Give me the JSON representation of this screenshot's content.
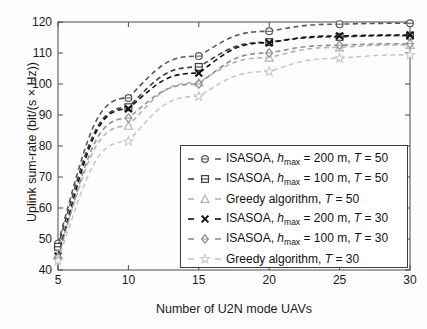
{
  "chart_data": {
    "type": "line",
    "title": "",
    "xlabel": "Number of U2N mode UAVs",
    "ylabel": "Uplink sum-rate (bit/(s × Hz))",
    "x": [
      5,
      10,
      15,
      20,
      25,
      30
    ],
    "xlim": [
      5,
      30
    ],
    "ylim": [
      40,
      120
    ],
    "xticks": [
      "5",
      "10",
      "15",
      "20",
      "25",
      "30"
    ],
    "yticks": [
      "40",
      "50",
      "60",
      "70",
      "80",
      "90",
      "100",
      "110",
      "120"
    ],
    "grid": false,
    "legend_position": "lower-right-inside",
    "series": [
      {
        "name": "ISASOA, h_max = 200 m, T = 50",
        "marker": "circle",
        "color": "#585858",
        "linestyle": "dashed",
        "values": [
          48.5,
          95.5,
          109.0,
          117.0,
          119.3,
          119.6
        ]
      },
      {
        "name": "ISASOA, h_max = 100 m, T = 50",
        "marker": "square",
        "color": "#404040",
        "linestyle": "dashed",
        "values": [
          47.5,
          92.5,
          105.5,
          113.5,
          115.2,
          115.6
        ]
      },
      {
        "name": "Greedy algorithm, T = 50",
        "marker": "triangle",
        "color": "#b4b4b4",
        "linestyle": "dashed",
        "values": [
          45.0,
          86.5,
          100.5,
          108.5,
          111.8,
          112.6
        ]
      },
      {
        "name": "ISASOA, h_max = 200 m, T = 30",
        "marker": "cross",
        "color": "#101010",
        "linestyle": "dashed",
        "values": [
          44.5,
          92.0,
          103.5,
          113.3,
          115.5,
          115.8
        ]
      },
      {
        "name": "ISASOA, h_max = 100 m, T = 30",
        "marker": "diamond",
        "color": "#909090",
        "linestyle": "dashed",
        "values": [
          44.0,
          89.0,
          100.0,
          110.0,
          112.5,
          113.0
        ]
      },
      {
        "name": "Greedy algorithm, T = 30",
        "marker": "star",
        "color": "#c8c8c8",
        "linestyle": "dashed",
        "values": [
          43.0,
          81.5,
          96.0,
          104.0,
          108.3,
          109.4
        ]
      }
    ]
  },
  "legend": {
    "entries": [
      {
        "prefix": "ISASOA, ",
        "hvar": "h",
        "sub": "max",
        "mid": " =  200 m, ",
        "tvar": "T",
        "tval": " = 50",
        "marker": "circle",
        "color": "#585858"
      },
      {
        "prefix": "ISASOA, ",
        "hvar": "h",
        "sub": "max",
        "mid": " = 100 m, ",
        "tvar": "T",
        "tval": " = 50",
        "marker": "square",
        "color": "#404040"
      },
      {
        "prefix": "Greedy algorithm, ",
        "hvar": "",
        "sub": "",
        "mid": "",
        "tvar": "T",
        "tval": " = 50",
        "marker": "triangle",
        "color": "#b4b4b4"
      },
      {
        "prefix": "ISASOA, ",
        "hvar": "h",
        "sub": "max",
        "mid": " = 200 m, ",
        "tvar": "T",
        "tval": " = 30",
        "marker": "cross",
        "color": "#101010"
      },
      {
        "prefix": "ISASOA, ",
        "hvar": "h",
        "sub": "max",
        "mid": " = 100 m, ",
        "tvar": "T",
        "tval": " = 30",
        "marker": "diamond",
        "color": "#909090"
      },
      {
        "prefix": "Greedy algorithm, ",
        "hvar": "",
        "sub": "",
        "mid": "",
        "tvar": "T",
        "tval": " = 30",
        "marker": "star",
        "color": "#c8c8c8"
      }
    ]
  }
}
